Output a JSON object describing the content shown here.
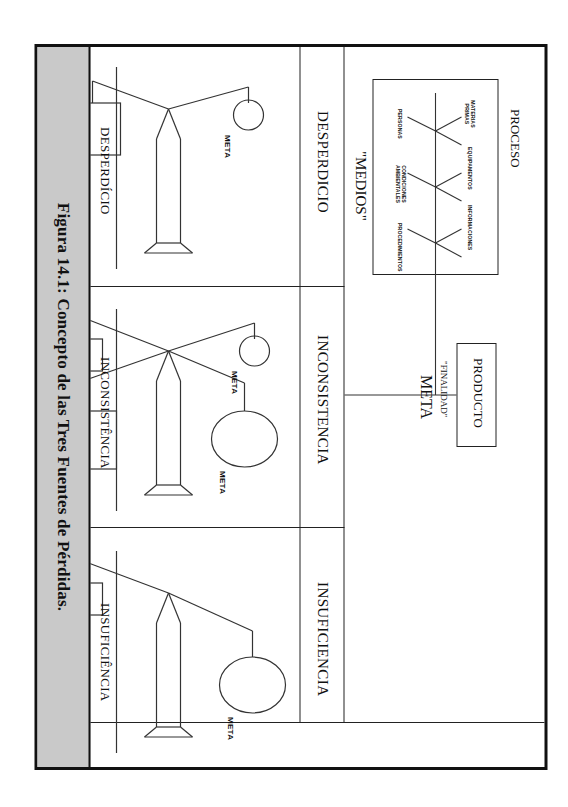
{
  "figure": {
    "caption": "Figura 14.1: Concepto de las Tres Fuentes de Pérdidas.",
    "caption_band_color": "#c9c9c9",
    "border_color": "#111111",
    "line_color": "#222222"
  },
  "header": {
    "process_title": "PROCESO",
    "process_inputs": [
      "MATERIAS PRIMAS",
      "EQUIPAMENTOS",
      "INFORMACIONES",
      "PERSONAS",
      "CONDICIONES AMBIENTALES",
      "PROCEDIMIENTOS"
    ],
    "process_caption_quoted": "\"MEDIOS\"",
    "product_box_label": "PRODUCTO",
    "product_caption_quoted": "\"FINALIDAD\"",
    "product_caption_word": "META"
  },
  "sections": [
    {
      "id": "desperdicio",
      "title": "DESPERDICIO",
      "baseline_label": "DESPERDÍCIO",
      "shapes": [
        {
          "kind": "box",
          "size": "large",
          "label": "MEDIOS"
        },
        {
          "kind": "circle",
          "size": "small",
          "label": "META"
        }
      ]
    },
    {
      "id": "inconsistencia",
      "title": "INCONSISTENCIA",
      "baseline_label": "INCONSISTÊNCIA",
      "shapes": [
        {
          "kind": "box",
          "size": "small",
          "label": "MEDIOS"
        },
        {
          "kind": "circle",
          "size": "small",
          "label": "META"
        },
        {
          "kind": "box",
          "size": "large",
          "label": "MEDIOS"
        },
        {
          "kind": "circle",
          "size": "large",
          "label": "META"
        }
      ]
    },
    {
      "id": "insuficiencia",
      "title": "INSUFICIENCIA",
      "baseline_label": "INSUFICIÊNCIA",
      "shapes": [
        {
          "kind": "box",
          "size": "small",
          "label": "MEDIOS"
        },
        {
          "kind": "circle",
          "size": "large",
          "label": "META"
        }
      ]
    }
  ]
}
